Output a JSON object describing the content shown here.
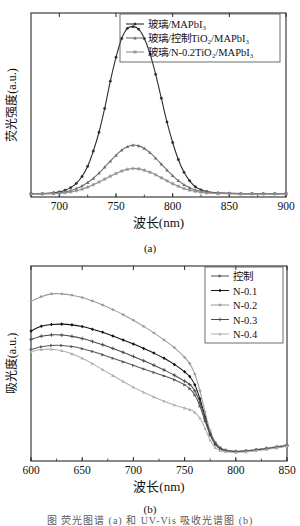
{
  "figure": {
    "panel_a_caption": "(a)",
    "panel_b_caption": "(b)",
    "footer_text": "图 荧光图谱 (a) 和 UV-Vis 吸收光谱图 (b)"
  },
  "chart_data": [
    {
      "id": "panel-a",
      "type": "line",
      "title": "",
      "xlabel": "波长(nm)",
      "ylabel": "荧光强度(a.u.)",
      "xlim": [
        675,
        900
      ],
      "ylim": [
        0,
        1.08
      ],
      "xticks": [
        700,
        750,
        800,
        850,
        900
      ],
      "yticks": [],
      "grid": false,
      "legend_position": "top-center",
      "caption": "(a)",
      "x": [
        675,
        685,
        695,
        700,
        705,
        710,
        715,
        720,
        725,
        730,
        735,
        740,
        745,
        750,
        755,
        760,
        765,
        770,
        775,
        780,
        785,
        790,
        795,
        800,
        805,
        810,
        815,
        820,
        825,
        830,
        840,
        850,
        860,
        870,
        880,
        890,
        900
      ],
      "series": [
        {
          "name": "玻璃/MAPbI₃",
          "color": "#2e2e2e",
          "marker": "circle",
          "values": [
            0.02,
            0.02,
            0.025,
            0.03,
            0.04,
            0.055,
            0.08,
            0.12,
            0.18,
            0.27,
            0.38,
            0.52,
            0.68,
            0.82,
            0.93,
            0.99,
            1.0,
            0.985,
            0.93,
            0.84,
            0.72,
            0.58,
            0.44,
            0.32,
            0.22,
            0.145,
            0.095,
            0.06,
            0.042,
            0.032,
            0.024,
            0.021,
            0.02,
            0.02,
            0.02,
            0.02,
            0.02
          ]
        },
        {
          "name": "玻璃/控制TiO₂/MAPbI₃",
          "color": "#6e6e6e",
          "marker": "triangle",
          "values": [
            0.02,
            0.02,
            0.022,
            0.025,
            0.03,
            0.038,
            0.05,
            0.065,
            0.085,
            0.11,
            0.14,
            0.175,
            0.21,
            0.245,
            0.275,
            0.295,
            0.305,
            0.3,
            0.285,
            0.26,
            0.228,
            0.193,
            0.158,
            0.125,
            0.096,
            0.072,
            0.054,
            0.041,
            0.033,
            0.028,
            0.023,
            0.021,
            0.02,
            0.02,
            0.02,
            0.02,
            0.02
          ]
        },
        {
          "name": "玻璃/N-0.2TiO₂/MAPbI₃",
          "color": "#8f8f8f",
          "marker": "star",
          "values": [
            0.018,
            0.018,
            0.02,
            0.022,
            0.025,
            0.03,
            0.037,
            0.046,
            0.058,
            0.072,
            0.088,
            0.105,
            0.122,
            0.138,
            0.152,
            0.162,
            0.167,
            0.165,
            0.157,
            0.145,
            0.13,
            0.113,
            0.095,
            0.078,
            0.063,
            0.05,
            0.04,
            0.033,
            0.028,
            0.024,
            0.021,
            0.019,
            0.018,
            0.018,
            0.018,
            0.018,
            0.018
          ]
        }
      ]
    },
    {
      "id": "panel-b",
      "type": "line",
      "title": "",
      "xlabel": "波长(nm)",
      "ylabel": "吸光度(a.u.)",
      "xlim": [
        600,
        850
      ],
      "ylim": [
        0,
        1.05
      ],
      "xticks": [
        600,
        650,
        700,
        750,
        800,
        850
      ],
      "yticks": [],
      "grid": false,
      "legend_position": "top-right",
      "caption": "(b)",
      "x": [
        600,
        610,
        620,
        630,
        640,
        650,
        660,
        670,
        680,
        690,
        700,
        710,
        720,
        730,
        740,
        750,
        755,
        760,
        765,
        770,
        775,
        780,
        785,
        790,
        800,
        810,
        820,
        830,
        840,
        850
      ],
      "series": [
        {
          "name": "控制",
          "color": "#595959",
          "marker": "triangle-right",
          "values": [
            0.6,
            0.615,
            0.622,
            0.622,
            0.616,
            0.605,
            0.59,
            0.572,
            0.553,
            0.534,
            0.515,
            0.496,
            0.477,
            0.458,
            0.437,
            0.41,
            0.39,
            0.355,
            0.295,
            0.215,
            0.14,
            0.09,
            0.065,
            0.055,
            0.05,
            0.053,
            0.058,
            0.065,
            0.072,
            0.082
          ]
        },
        {
          "name": "N-0.1",
          "color": "#111111",
          "marker": "diamond",
          "values": [
            0.7,
            0.725,
            0.735,
            0.737,
            0.733,
            0.724,
            0.71,
            0.693,
            0.673,
            0.652,
            0.63,
            0.606,
            0.581,
            0.553,
            0.52,
            0.48,
            0.455,
            0.41,
            0.335,
            0.238,
            0.15,
            0.095,
            0.068,
            0.057,
            0.051,
            0.054,
            0.06,
            0.067,
            0.075,
            0.085
          ]
        },
        {
          "name": "N-0.2",
          "color": "#9a9a9a",
          "marker": "circle",
          "values": [
            0.86,
            0.885,
            0.9,
            0.9,
            0.893,
            0.88,
            0.862,
            0.84,
            0.815,
            0.788,
            0.758,
            0.725,
            0.69,
            0.652,
            0.61,
            0.558,
            0.525,
            0.468,
            0.378,
            0.262,
            0.163,
            0.102,
            0.072,
            0.06,
            0.053,
            0.056,
            0.062,
            0.07,
            0.078,
            0.088
          ]
        },
        {
          "name": "N-0.3",
          "color": "#4a4a4a",
          "marker": "plus",
          "values": [
            0.655,
            0.672,
            0.679,
            0.678,
            0.671,
            0.659,
            0.644,
            0.626,
            0.606,
            0.585,
            0.563,
            0.54,
            0.516,
            0.49,
            0.462,
            0.43,
            0.412,
            0.378,
            0.315,
            0.228,
            0.145,
            0.092,
            0.066,
            0.056,
            0.05,
            0.053,
            0.059,
            0.066,
            0.073,
            0.083
          ]
        },
        {
          "name": "N-0.4",
          "color": "#b0b0b0",
          "marker": "triangle",
          "values": [
            0.588,
            0.6,
            0.602,
            0.594,
            0.577,
            0.553,
            0.524,
            0.492,
            0.46,
            0.428,
            0.398,
            0.37,
            0.345,
            0.322,
            0.302,
            0.285,
            0.277,
            0.262,
            0.23,
            0.175,
            0.112,
            0.072,
            0.056,
            0.05,
            0.046,
            0.049,
            0.055,
            0.062,
            0.07,
            0.08
          ]
        }
      ]
    }
  ]
}
